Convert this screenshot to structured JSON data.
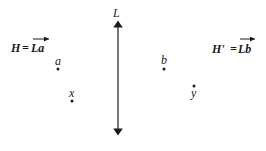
{
  "diagram": {
    "line_label": "L",
    "left_half_plane": {
      "name": "H",
      "equals": "=",
      "vector": "La",
      "full": "H = La"
    },
    "right_half_plane": {
      "name": "H'",
      "equals": "=",
      "vector": "Lb",
      "full": "H' = Lb"
    },
    "points": [
      {
        "label": "a",
        "side": "left"
      },
      {
        "label": "x",
        "side": "left"
      },
      {
        "label": "b",
        "side": "right"
      },
      {
        "label": "y",
        "side": "right"
      }
    ],
    "colors": {
      "ink": "#1a1a1a",
      "background": "#ffffff"
    }
  }
}
